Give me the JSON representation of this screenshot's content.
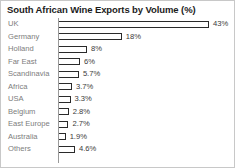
{
  "chart_data": {
    "type": "bar",
    "orientation": "horizontal",
    "title": "South African Wine Exports by Volume (%)",
    "xlabel": "",
    "ylabel": "",
    "xlim": [
      0,
      43
    ],
    "grid": false,
    "legend": false,
    "categories": [
      "UK",
      "Germany",
      "Holland",
      "Far East",
      "Scandinavia",
      "Africa",
      "USA",
      "Belgium",
      "East Europe",
      "Australia",
      "Others"
    ],
    "values": [
      43,
      18,
      8,
      6,
      5.7,
      3.7,
      3.3,
      2.8,
      2.7,
      1.9,
      4.6
    ],
    "value_labels": [
      "43%",
      "18%",
      "8%",
      "6%",
      "5.7%",
      "3.7%",
      "3.3%",
      "2.8%",
      "2.7%",
      "1.9%",
      "4.6%"
    ],
    "bar_style": "outlined",
    "colors": {
      "bar_outline": "#2a2a2a",
      "bar_fill": "#ffffff",
      "title": "#1c1c1c",
      "category_label": "#7d7d7d",
      "value_label": "#3a3a3a",
      "axis": "#9a9a9a",
      "frame": "#c8c8c8",
      "background": "#ffffff"
    }
  }
}
